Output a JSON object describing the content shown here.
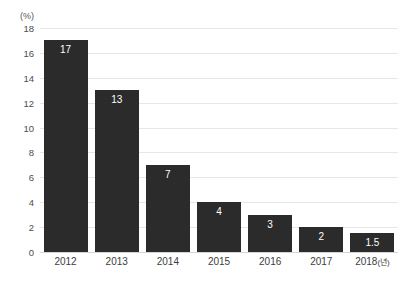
{
  "chart_data": {
    "type": "bar",
    "title": "",
    "subtitle": "",
    "xlabel": "",
    "ylabel": "",
    "unit_label": "(%)",
    "x_axis_suffix": "(년)",
    "categories": [
      "2012",
      "2013",
      "2014",
      "2015",
      "2016",
      "2017",
      "2018"
    ],
    "category_labels": [
      "2012",
      "2013",
      "2014",
      "2015",
      "2016",
      "2017",
      "2018(년)"
    ],
    "values": [
      17,
      13,
      7,
      4,
      3,
      2,
      1.5
    ],
    "value_labels": [
      "17",
      "13",
      "7",
      "4",
      "3",
      "2",
      "1.5"
    ],
    "ylim": [
      0,
      18
    ],
    "ytick_step": 2,
    "ytick_labels": [
      "18",
      "16",
      "14",
      "12",
      "10",
      "8",
      "6",
      "4",
      "2",
      "0"
    ],
    "ytick_values": [
      18,
      16,
      14,
      12,
      10,
      8,
      6,
      4,
      2,
      0
    ],
    "grid": true,
    "grid_axis": "y",
    "legend": false,
    "legend_position": "none",
    "colors": {
      "bar": "#2b2b2b",
      "value_label": "#ffffff",
      "gridline": "#e6e6e6",
      "baseline": "#d4d4d4",
      "axis_text": "#4d4d4d",
      "background": "#ffffff"
    }
  }
}
